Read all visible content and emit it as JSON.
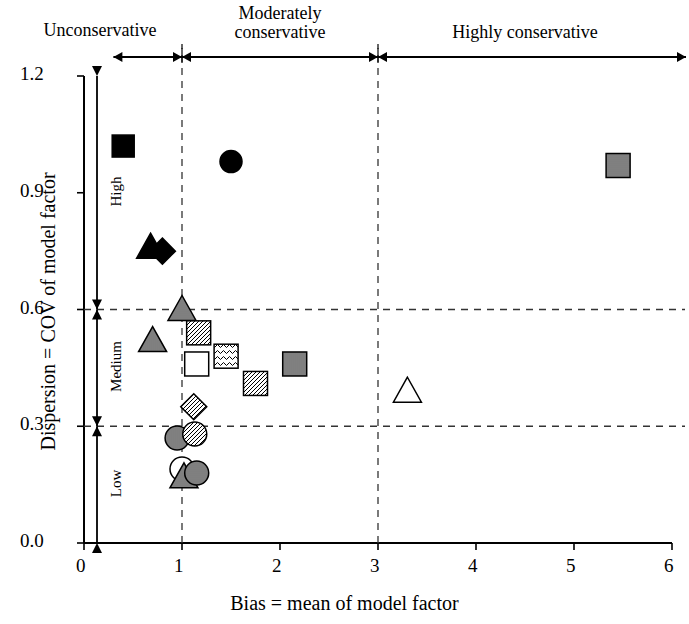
{
  "figure": {
    "x_axis_title": "Bias = mean of model factor",
    "y_axis_title": "Dispersion = COV of model factor"
  },
  "zones": [
    {
      "name": "unconservative",
      "label": "Unconservative",
      "x_start": 0.0,
      "x_end": 1.0
    },
    {
      "name": "moderately-conservative",
      "label": "Moderately\nconservative",
      "label_line1": "Moderately",
      "label_line2": "conservative",
      "x_start": 1.0,
      "x_end": 3.0
    },
    {
      "name": "highly-conservative",
      "label": "Highly conservative",
      "x_start": 3.0,
      "x_end": 6.0
    }
  ],
  "bands": [
    {
      "name": "high",
      "label": "High",
      "y_start": 0.6,
      "y_end": 1.2
    },
    {
      "name": "medium",
      "label": "Medium",
      "y_start": 0.3,
      "y_end": 0.6
    },
    {
      "name": "low",
      "label": "Low",
      "y_start": 0.0,
      "y_end": 0.3
    }
  ],
  "chart_data": {
    "type": "scatter",
    "title": "",
    "xlabel": "Bias = mean of model factor",
    "ylabel": "Dispersion = COV of model factor",
    "xlim": [
      0,
      6
    ],
    "ylim": [
      0.0,
      1.2
    ],
    "xticks": [
      "0",
      "1",
      "2",
      "3",
      "4",
      "5",
      "6"
    ],
    "xtick_values": [
      0,
      1,
      2,
      3,
      4,
      5,
      6
    ],
    "yticks": [
      "0.0",
      "0.3",
      "0.6",
      "0.9",
      "1.2"
    ],
    "ytick_values": [
      0.0,
      0.3,
      0.6,
      0.9,
      1.2
    ],
    "grid": false,
    "reference_lines": {
      "vertical": [
        1,
        3
      ],
      "horizontal": [
        0.3,
        0.6
      ],
      "style": "dashed"
    },
    "legend": "none",
    "points": [
      {
        "id": "p1",
        "x": 0.4,
        "y": 1.02,
        "marker": "square",
        "fill": "solid"
      },
      {
        "id": "p2",
        "x": 1.5,
        "y": 0.98,
        "marker": "circle",
        "fill": "solid"
      },
      {
        "id": "p3",
        "x": 5.45,
        "y": 0.97,
        "marker": "square",
        "fill": "horizontal-stripe"
      },
      {
        "id": "p4",
        "x": 0.68,
        "y": 0.76,
        "marker": "triangle",
        "fill": "solid"
      },
      {
        "id": "p5",
        "x": 0.8,
        "y": 0.75,
        "marker": "diamond",
        "fill": "solid"
      },
      {
        "id": "p6",
        "x": 1.0,
        "y": 0.6,
        "marker": "triangle",
        "fill": "horizontal-stripe"
      },
      {
        "id": "p7",
        "x": 0.7,
        "y": 0.52,
        "marker": "triangle",
        "fill": "vertical-stripe"
      },
      {
        "id": "p8",
        "x": 1.17,
        "y": 0.54,
        "marker": "square",
        "fill": "diagonal-hatch"
      },
      {
        "id": "p9",
        "x": 1.45,
        "y": 0.48,
        "marker": "square",
        "fill": "wave-hatch"
      },
      {
        "id": "p10",
        "x": 1.15,
        "y": 0.46,
        "marker": "square",
        "fill": "open"
      },
      {
        "id": "p11",
        "x": 2.15,
        "y": 0.46,
        "marker": "square",
        "fill": "vertical-stripe"
      },
      {
        "id": "p12",
        "x": 1.75,
        "y": 0.41,
        "marker": "square",
        "fill": "diagonal-hatch"
      },
      {
        "id": "p13",
        "x": 3.3,
        "y": 0.39,
        "marker": "triangle",
        "fill": "open"
      },
      {
        "id": "p14",
        "x": 1.12,
        "y": 0.35,
        "marker": "diamond",
        "fill": "diagonal-hatch"
      },
      {
        "id": "p15",
        "x": 0.95,
        "y": 0.27,
        "marker": "circle",
        "fill": "vertical-stripe"
      },
      {
        "id": "p16",
        "x": 1.13,
        "y": 0.28,
        "marker": "circle",
        "fill": "diagonal-hatch"
      },
      {
        "id": "p17",
        "x": 1.0,
        "y": 0.19,
        "marker": "circle",
        "fill": "open"
      },
      {
        "id": "p18",
        "x": 1.02,
        "y": 0.17,
        "marker": "triangle",
        "fill": "horizontal-stripe"
      },
      {
        "id": "p19",
        "x": 1.15,
        "y": 0.18,
        "marker": "circle",
        "fill": "horizontal-stripe"
      }
    ]
  }
}
